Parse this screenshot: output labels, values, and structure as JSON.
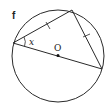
{
  "diagram": {
    "part_label": "f",
    "angle_label": "x",
    "center_label": "O",
    "circle": {
      "cx": 58,
      "cy": 56,
      "r": 46
    },
    "points": {
      "A": {
        "x": 13,
        "y": 43
      },
      "B": {
        "x": 72,
        "y": 10
      },
      "C": {
        "x": 102,
        "y": 69
      },
      "O": {
        "x": 58,
        "y": 56
      }
    },
    "segments": [
      "AB",
      "BC",
      "AC"
    ],
    "equal_marks": [
      "AB",
      "BC"
    ],
    "stroke_color": "#2a2a2a"
  }
}
